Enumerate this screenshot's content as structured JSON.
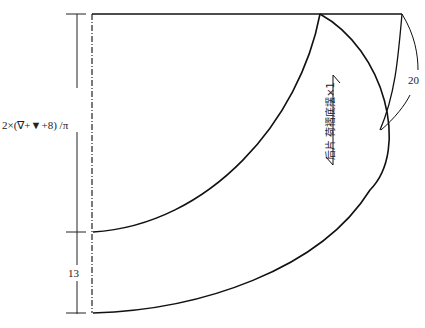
{
  "diagram": {
    "type": "sewing-pattern",
    "dimension_labels": {
      "radius": "2×(∇+▼+8) /π",
      "hem_width": "13",
      "seam_allowance": "20"
    },
    "piece_label": "后片 荷褶底摆×1",
    "colors": {
      "line": "#111111",
      "background": "#ffffff"
    }
  }
}
